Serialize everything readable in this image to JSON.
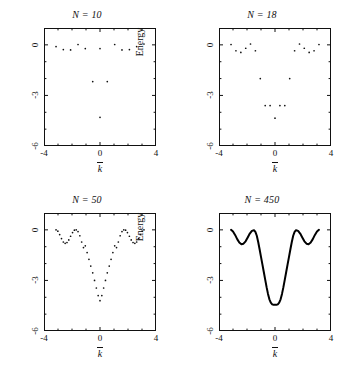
{
  "figure": {
    "ylabel": "Energy",
    "xlabel_base": "k",
    "xlabel_accent": "overbar"
  },
  "axes": {
    "xticks": [
      -4,
      0,
      4
    ],
    "xtick_labels": [
      "-4",
      "0",
      "4"
    ],
    "yticks": [
      0,
      -3,
      -6
    ],
    "ytick_labels": [
      "0",
      "-3",
      "-6"
    ],
    "xlim": [
      -4,
      4
    ],
    "ylim": [
      -6,
      1
    ],
    "x_minor_count": 3,
    "y_minor_count": 2
  },
  "chart_data": [
    {
      "type": "scatter",
      "title": "N = 10",
      "xlabel": "k̄",
      "ylabel": "Energy",
      "xlim": [
        -4,
        4
      ],
      "ylim": [
        -6,
        1
      ],
      "grid": false,
      "legend": "none",
      "marker": "dot",
      "x": [
        -2.62,
        -2.1,
        -1.57,
        -1.05,
        -0.52,
        0.0,
        0.0,
        0.52,
        1.05,
        1.57,
        2.1,
        2.62,
        3.14,
        -3.14
      ],
      "y": [
        -0.28,
        -0.3,
        0.02,
        -0.22,
        -2.18,
        -4.3,
        -0.22,
        -2.18,
        0.02,
        -0.3,
        -0.28,
        -0.1,
        0.05,
        -0.1
      ]
    },
    {
      "type": "scatter",
      "title": "N = 18",
      "xlabel": "k̄",
      "ylabel": "Energy",
      "xlim": [
        -4,
        4
      ],
      "ylim": [
        -6,
        1
      ],
      "grid": false,
      "legend": "none",
      "marker": "dot",
      "x": [
        -3.14,
        -2.79,
        -2.44,
        -2.09,
        -1.75,
        -1.4,
        -1.05,
        -0.7,
        -0.35,
        0.0,
        0.35,
        0.7,
        1.05,
        1.4,
        1.75,
        2.09,
        2.44,
        2.79,
        3.14
      ],
      "y": [
        0.02,
        -0.35,
        -0.45,
        -0.2,
        0.05,
        -0.35,
        -2.0,
        -3.6,
        -3.6,
        -4.35,
        -3.6,
        -3.6,
        -2.0,
        -0.35,
        0.05,
        -0.2,
        -0.45,
        -0.35,
        0.02
      ]
    },
    {
      "type": "scatter",
      "title": "N = 50",
      "xlabel": "k̄",
      "ylabel": "Energy",
      "xlim": [
        -4,
        4
      ],
      "ylim": [
        -6,
        1
      ],
      "grid": false,
      "legend": "none",
      "marker": "dot",
      "n_points": 50,
      "curve_model": "two-well band: side oscillation amplitude 0.75 with deep central well min -4.35 at k=0, shoulders near k=+/-1.2",
      "x": [
        -3.14,
        -3.01,
        -2.88,
        -2.75,
        -2.62,
        -2.49,
        -2.36,
        -2.23,
        -2.1,
        -1.96,
        -1.83,
        -1.7,
        -1.57,
        -1.44,
        -1.31,
        -1.18,
        -1.05,
        -0.92,
        -0.79,
        -0.66,
        -0.52,
        -0.39,
        -0.26,
        -0.13,
        0.0,
        0.13,
        0.26,
        0.39,
        0.52,
        0.66,
        0.79,
        0.92,
        1.05,
        1.18,
        1.31,
        1.44,
        1.57,
        1.7,
        1.83,
        1.96,
        2.1,
        2.23,
        2.36,
        2.49,
        2.62,
        2.75,
        2.88,
        3.01,
        3.14
      ],
      "y": [
        0.0,
        -0.08,
        -0.28,
        -0.52,
        -0.72,
        -0.8,
        -0.75,
        -0.6,
        -0.38,
        -0.16,
        -0.02,
        0.0,
        -0.1,
        -0.35,
        -0.72,
        -1.05,
        -0.95,
        -1.35,
        -1.75,
        -2.15,
        -2.55,
        -3.0,
        -3.45,
        -3.9,
        -4.2,
        -3.9,
        -3.45,
        -3.0,
        -2.55,
        -2.15,
        -1.75,
        -1.35,
        -0.95,
        -1.05,
        -0.72,
        -0.35,
        -0.1,
        0.0,
        -0.02,
        -0.16,
        -0.38,
        -0.6,
        -0.75,
        -0.8,
        -0.72,
        -0.52,
        -0.28,
        -0.08,
        0.0
      ]
    },
    {
      "type": "line",
      "title": "N = 450",
      "xlabel": "k̄",
      "ylabel": "Energy",
      "xlim": [
        -4,
        4
      ],
      "ylim": [
        -6,
        1
      ],
      "grid": false,
      "legend": "none",
      "marker": "none",
      "line_width": 2,
      "curve_model": "smooth continuous limit of the N=50 band structure",
      "x": [
        -3.14,
        -3.0,
        -2.85,
        -2.7,
        -2.55,
        -2.4,
        -2.25,
        -2.1,
        -1.95,
        -1.8,
        -1.65,
        -1.5,
        -1.4,
        -1.3,
        -1.2,
        -1.1,
        -1.0,
        -0.9,
        -0.8,
        -0.7,
        -0.6,
        -0.5,
        -0.4,
        -0.3,
        -0.2,
        -0.1,
        0.0,
        0.1,
        0.2,
        0.3,
        0.4,
        0.5,
        0.6,
        0.7,
        0.8,
        0.9,
        1.0,
        1.1,
        1.2,
        1.3,
        1.4,
        1.5,
        1.65,
        1.8,
        1.95,
        2.1,
        2.25,
        2.4,
        2.55,
        2.7,
        2.85,
        3.0,
        3.14
      ],
      "y": [
        0.0,
        -0.1,
        -0.3,
        -0.55,
        -0.75,
        -0.85,
        -0.82,
        -0.68,
        -0.45,
        -0.22,
        -0.06,
        -0.02,
        -0.12,
        -0.35,
        -0.72,
        -1.15,
        -1.6,
        -2.05,
        -2.5,
        -2.95,
        -3.4,
        -3.8,
        -4.12,
        -4.32,
        -4.42,
        -4.45,
        -4.45,
        -4.45,
        -4.42,
        -4.32,
        -4.12,
        -3.8,
        -3.4,
        -2.95,
        -2.5,
        -2.05,
        -1.6,
        -1.15,
        -0.72,
        -0.35,
        -0.12,
        -0.02,
        -0.06,
        -0.22,
        -0.45,
        -0.68,
        -0.82,
        -0.85,
        -0.75,
        -0.55,
        -0.3,
        -0.1,
        0.0
      ]
    }
  ],
  "style": {
    "axis_color": "#111111",
    "marker_color": "#111111",
    "line_color": "#000000",
    "background": "#ffffff"
  }
}
